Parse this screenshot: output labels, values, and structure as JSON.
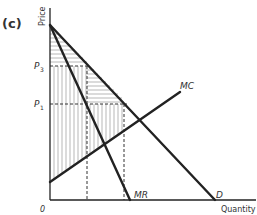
{
  "panel_label": "(c)",
  "axes": {
    "y_label": "Price",
    "x_label": "Quantity",
    "origin_label": "0"
  },
  "price_levels": [
    {
      "label": "P",
      "sub": "3"
    },
    {
      "label": "P",
      "sub": "1"
    }
  ],
  "curves": {
    "mc": "MC",
    "mr": "MR",
    "demand": "D"
  },
  "colors": {
    "line": "#222222",
    "hatch": "#888888",
    "text": "#333333"
  }
}
